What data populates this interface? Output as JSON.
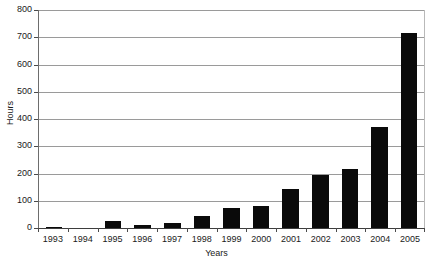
{
  "chart_data": {
    "type": "bar",
    "title": "",
    "subtitle": "",
    "xlabel": "Years",
    "ylabel": "Hours",
    "categories": [
      "1993",
      "1994",
      "1995",
      "1996",
      "1997",
      "1998",
      "1999",
      "2000",
      "2001",
      "2002",
      "2003",
      "2004",
      "2005"
    ],
    "values": [
      4,
      0,
      25,
      11,
      19,
      43,
      72,
      82,
      145,
      193,
      217,
      370,
      715
    ],
    "series": [
      {
        "name": "Hours",
        "values": [
          4,
          0,
          25,
          11,
          19,
          43,
          72,
          82,
          145,
          193,
          217,
          370,
          715
        ]
      }
    ],
    "ylim": [
      0,
      800
    ],
    "ytick_values": [
      0,
      100,
      200,
      300,
      400,
      500,
      600,
      700,
      800
    ],
    "ytick_labels": [
      "0",
      "100",
      "200",
      "300",
      "400",
      "500",
      "600",
      "700",
      "800"
    ],
    "grid": true,
    "grid_axis": "y",
    "legend": false,
    "legend_position": "none",
    "bar_color": "#0a0a0a",
    "background_color": "#ffffff",
    "gridline_color": "#9a9a9a",
    "axis_color": "#3d3d3d"
  }
}
